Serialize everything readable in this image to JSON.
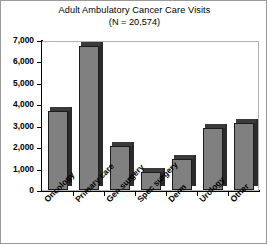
{
  "chart_data": {
    "type": "bar",
    "title": "Adult Ambulatory Cancer Care Visits",
    "subtitle": "(N = 20,574)",
    "xlabel": "",
    "ylabel": "",
    "ylim": [
      0,
      7000
    ],
    "ytick_values": [
      0,
      1000,
      2000,
      3000,
      4000,
      5000,
      6000,
      7000
    ],
    "ytick_labels": [
      "0",
      "1,000",
      "2,000",
      "3,000",
      "4,000",
      "5,000",
      "6,000",
      "7,000"
    ],
    "grid": false,
    "legend": "none",
    "categories": [
      "Oncology",
      "Primary care",
      "Gen surgery",
      "Spec surgery",
      "Derm",
      "Urology",
      "Other"
    ],
    "values": [
      3700,
      6700,
      2050,
      850,
      1450,
      2900,
      3150
    ],
    "bar_color": "#808080",
    "bar_side_color": "#2b2b2b",
    "bar_edge_color": "#1c1c1c",
    "axis_color": "#000000",
    "frame_color": "#b4b4b4",
    "background": "#ffffff"
  }
}
